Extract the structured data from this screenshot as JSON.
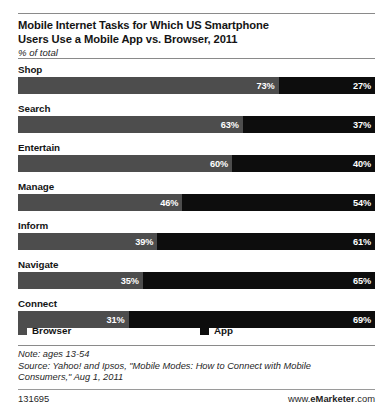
{
  "header": {
    "title_line1": "Mobile Internet Tasks for Which US Smartphone",
    "title_line2": "Users Use a Mobile App vs. Browser, 2011",
    "subtitle": "% of total"
  },
  "legend": {
    "browser_label": "Browser",
    "app_label": "App"
  },
  "notes": {
    "note": "Note: ages 13-54",
    "source_line1": "Source: Yahoo! and Ipsos, \"Mobile Modes: How to Connect with Mobile",
    "source_line2": "Consumers,\" Aug 1, 2011"
  },
  "footer": {
    "id": "131695",
    "brand_prefix": "www.",
    "brand_name": "eMarketer",
    "brand_suffix": ".com"
  },
  "chart_data": {
    "type": "bar",
    "orientation": "horizontal",
    "stacked": true,
    "title": "Mobile Internet Tasks for Which US Smartphone Users Use a Mobile App vs. Browser, 2011",
    "subtitle": "% of total",
    "xlabel": "",
    "ylabel": "",
    "xlim": [
      0,
      100
    ],
    "grid": false,
    "legend_position": "bottom",
    "categories": [
      "Shop",
      "Search",
      "Entertain",
      "Manage",
      "Inform",
      "Navigate",
      "Connect"
    ],
    "series": [
      {
        "name": "Browser",
        "color": "#4d4d4d",
        "values": [
          73,
          63,
          60,
          46,
          39,
          35,
          31
        ],
        "labels": [
          "73%",
          "63%",
          "60%",
          "46%",
          "39%",
          "35%",
          "31%"
        ]
      },
      {
        "name": "App",
        "color": "#0d0d0d",
        "values": [
          27,
          37,
          40,
          54,
          61,
          65,
          69
        ],
        "labels": [
          "27%",
          "37%",
          "40%",
          "54%",
          "61%",
          "65%",
          "69%"
        ]
      }
    ]
  }
}
